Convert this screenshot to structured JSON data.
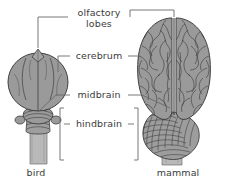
{
  "figure": {
    "background_color": "#ffffff",
    "brain_fill_color": "#9a9a9a",
    "brain_outline_color": "#3d3d3d",
    "stem_fill_color": "#b5b5b5",
    "leader_line_color": "#5a5a5a",
    "text_color": "#3b3b3b"
  },
  "labels": {
    "olfactory_line1": "olfactory",
    "olfactory_line2": "lobes",
    "cerebrum": "cerebrum",
    "midbrain": "midbrain",
    "hindbrain": "hindbrain"
  },
  "captions": {
    "bird": "bird",
    "mammal": "mammal"
  },
  "specimens": [
    {
      "name": "bird",
      "caption": "bird",
      "side": "left",
      "parts": [
        "olfactory lobes",
        "cerebrum",
        "midbrain",
        "hindbrain"
      ]
    },
    {
      "name": "mammal",
      "caption": "mammal",
      "side": "right",
      "parts": [
        "olfactory lobes",
        "cerebrum",
        "midbrain",
        "hindbrain"
      ]
    }
  ]
}
